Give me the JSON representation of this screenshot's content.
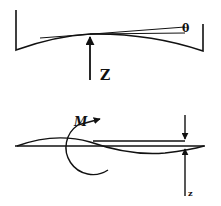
{
  "diagram": {
    "colors": {
      "ink": "#111111",
      "background": "#ffffff"
    },
    "top_figure": {
      "description": "Plate with upturned ends deflected by upward point force Z; tangent angle theta",
      "labels": {
        "angle": "θ",
        "force": "Z"
      }
    },
    "bottom_figure": {
      "description": "Beam under bending moment M and vertical forces at right end",
      "labels": {
        "moment": "M",
        "force": "z"
      }
    }
  }
}
